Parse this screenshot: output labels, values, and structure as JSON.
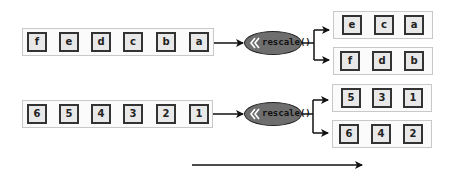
{
  "rows": [
    {
      "input_cells": [
        "f",
        "e",
        "d",
        "c",
        "b",
        "a"
      ],
      "operation": {
        "label": "rescale()",
        "icon": "double-chevron-left-icon"
      },
      "outputs": [
        {
          "cells": [
            "e",
            "c",
            "a"
          ]
        },
        {
          "cells": [
            "f",
            "d",
            "b"
          ]
        }
      ]
    },
    {
      "input_cells": [
        "6",
        "5",
        "4",
        "3",
        "2",
        "1"
      ],
      "operation": {
        "label": "rescale()",
        "icon": "double-chevron-left-icon"
      },
      "outputs": [
        {
          "cells": [
            "5",
            "3",
            "1"
          ]
        },
        {
          "cells": [
            "6",
            "4",
            "2"
          ]
        }
      ]
    }
  ],
  "colors": {
    "cell_fill": "#e8e8e8",
    "cell_border": "#333333",
    "operation_fill": "#6e6e6e",
    "group_border": "#c8c8c8"
  }
}
